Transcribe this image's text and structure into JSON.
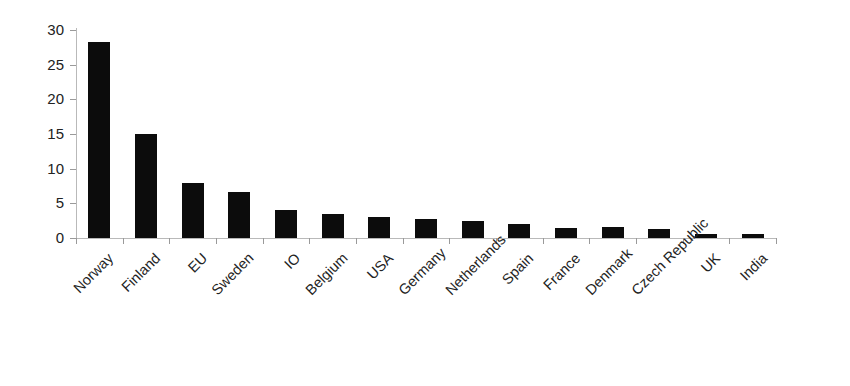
{
  "chart_data": {
    "type": "bar",
    "title": "",
    "subtitle": "",
    "xlabel": "",
    "ylabel": "",
    "ylim": [
      0,
      30
    ],
    "y_ticks": [
      0,
      5,
      10,
      15,
      20,
      25,
      30
    ],
    "grid": false,
    "legend": false,
    "bar_color": "#0c0c0c",
    "axis_color": "#b9b9b9",
    "label_rotation_deg": -45,
    "categories": [
      "Norway",
      "Finland",
      "EU",
      "Sweden",
      "IO",
      "Belgium",
      "USA",
      "Germany",
      "Netherlands",
      "Spain",
      "France",
      "Denmark",
      "Czech Republic",
      "UK",
      "India"
    ],
    "values": [
      28.3,
      15.0,
      8.0,
      6.6,
      4.0,
      3.5,
      3.1,
      2.8,
      2.4,
      2.0,
      1.5,
      1.6,
      1.3,
      0.6,
      0.6
    ]
  }
}
